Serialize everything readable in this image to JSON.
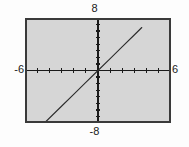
{
  "figure": {
    "kind": "graphing-calculator-screen",
    "background_color": "#fdfdfd",
    "screen_fill_color": "#d6d6d6",
    "frame_color": "#3a3a3a",
    "axis_color": "#1a1a1a",
    "curve_color": "#2b2b2b"
  },
  "labels": {
    "ymax": "8",
    "ymin": "-8",
    "xmin": "-6",
    "xmax": "6"
  },
  "chart_data": {
    "type": "line",
    "title": "",
    "xlabel": "",
    "ylabel": "",
    "xlim": [
      -6,
      6
    ],
    "ylim": [
      -8,
      8
    ],
    "grid": false,
    "legend": "none",
    "axes_shown": true,
    "xtick_interval": 1,
    "ytick_interval": 1,
    "xticks": [
      -5,
      -4,
      -3,
      -2,
      -1,
      1,
      2,
      3,
      4,
      5
    ],
    "yticks": [
      -7,
      -6,
      -5,
      -4,
      -3,
      -2,
      -1,
      1,
      2,
      3,
      4,
      5,
      6,
      7
    ],
    "annotations": [],
    "series": [
      {
        "name": "line",
        "style": "solid-thin",
        "x": [
          -4.4,
          -3.0,
          -2.0,
          -1.0,
          0.0,
          1.0,
          2.0,
          3.0,
          3.6
        ],
        "y": [
          -8.0,
          -5.45,
          -3.64,
          -1.82,
          0.0,
          1.82,
          3.64,
          5.45,
          6.55
        ],
        "slope": 1.82,
        "intercept": 0
      }
    ]
  }
}
